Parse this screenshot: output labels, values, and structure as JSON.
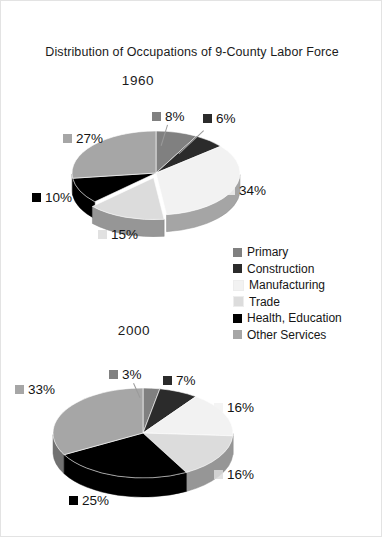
{
  "figure": {
    "title": "Distribution of Occupations of 9-County Labor Force",
    "background": "#ffffff"
  },
  "legend": {
    "position": "center-right",
    "items": [
      {
        "label": "Primary",
        "color": "#808080"
      },
      {
        "label": "Construction",
        "color": "#2b2b2b"
      },
      {
        "label": "Manufacturing",
        "color": "#f2f2f2"
      },
      {
        "label": "Trade",
        "color": "#dcdcdc"
      },
      {
        "label": "Health, Education",
        "color": "#000000"
      },
      {
        "label": "Other Services",
        "color": "#a6a6a6"
      }
    ]
  },
  "charts": [
    {
      "year": "1960",
      "labels": [
        {
          "text": "8%",
          "color": "#808080"
        },
        {
          "text": "6%",
          "color": "#2b2b2b"
        },
        {
          "text": "34%",
          "color": "#f2f2f2"
        },
        {
          "text": "15%",
          "color": "#dcdcdc"
        },
        {
          "text": "10%",
          "color": "#000000"
        },
        {
          "text": "27%",
          "color": "#a6a6a6"
        }
      ]
    },
    {
      "year": "2000",
      "labels": [
        {
          "text": "3%",
          "color": "#808080"
        },
        {
          "text": "7%",
          "color": "#2b2b2b"
        },
        {
          "text": "16%",
          "color": "#f2f2f2"
        },
        {
          "text": "16%",
          "color": "#dcdcdc"
        },
        {
          "text": "25%",
          "color": "#000000"
        },
        {
          "text": "33%",
          "color": "#a6a6a6"
        }
      ]
    }
  ],
  "chart_data": [
    {
      "type": "pie",
      "title": "1960",
      "categories": [
        "Primary",
        "Construction",
        "Manufacturing",
        "Trade",
        "Health, Education",
        "Other Services"
      ],
      "values": [
        8,
        6,
        34,
        15,
        10,
        27
      ],
      "value_labels": [
        "8%",
        "6%",
        "34%",
        "15%",
        "10%",
        "27%"
      ],
      "colors": [
        "#808080",
        "#2b2b2b",
        "#f2f2f2",
        "#dcdcdc",
        "#000000",
        "#a6a6a6"
      ],
      "units": "percent",
      "exploded_slices": [
        "Trade"
      ],
      "three_d": true,
      "legend_position": "center-right"
    },
    {
      "type": "pie",
      "title": "2000",
      "categories": [
        "Primary",
        "Construction",
        "Manufacturing",
        "Trade",
        "Health, Education",
        "Other Services"
      ],
      "values": [
        3,
        7,
        16,
        16,
        25,
        33
      ],
      "value_labels": [
        "3%",
        "7%",
        "16%",
        "16%",
        "25%",
        "33%"
      ],
      "colors": [
        "#808080",
        "#2b2b2b",
        "#f2f2f2",
        "#dcdcdc",
        "#000000",
        "#a6a6a6"
      ],
      "units": "percent",
      "exploded_slices": [],
      "three_d": true,
      "legend_position": "center-right"
    }
  ]
}
